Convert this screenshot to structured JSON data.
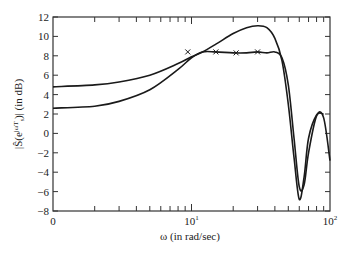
{
  "chart_data": {
    "type": "line",
    "title": "",
    "xlabel": "ω (in rad/sec)",
    "ylabel": "|Ŝ(e^{jωT_s})|  (in dB)",
    "xscale": "log",
    "xlim": [
      1,
      100
    ],
    "ylim": [
      -8,
      12
    ],
    "grid": false,
    "legend": null,
    "x_tick_labels": [
      "0",
      "10¹",
      "10²"
    ],
    "y_ticks": [
      -8,
      -6,
      -4,
      -2,
      0,
      2,
      4,
      6,
      8,
      10,
      12
    ],
    "series": [
      {
        "name": "curve-A (upper low-frequency)",
        "x": [
          1,
          2,
          3,
          5,
          8,
          10,
          12,
          15,
          20,
          25,
          30,
          35,
          40,
          45,
          50,
          55,
          60,
          65,
          70,
          80,
          90
        ],
        "y": [
          4.8,
          5.0,
          5.3,
          6.0,
          7.2,
          7.9,
          8.4,
          9.2,
          10.3,
          10.9,
          11.1,
          10.9,
          9.8,
          7.5,
          3.0,
          -2.5,
          -6.8,
          -4.5,
          -0.5,
          1.9,
          2.0
        ]
      },
      {
        "name": "curve-B (lower low-frequency)",
        "x": [
          1,
          2,
          3,
          5,
          8,
          10,
          12,
          15,
          20,
          25,
          30,
          35,
          40,
          45,
          50,
          55,
          60,
          65,
          70,
          80,
          90,
          100
        ],
        "y": [
          2.6,
          2.8,
          3.3,
          4.5,
          6.6,
          7.8,
          8.4,
          8.4,
          8.3,
          8.3,
          8.4,
          8.3,
          8.4,
          7.8,
          5.0,
          -0.5,
          -5.5,
          -5.3,
          -2.0,
          1.8,
          1.6,
          -2.8
        ]
      }
    ],
    "markers": {
      "symbol": "×",
      "x": [
        9.4,
        15,
        21,
        30
      ],
      "y": [
        8.4,
        8.4,
        8.3,
        8.4
      ]
    }
  },
  "axes": {
    "x_label": "ω (in rad/sec)",
    "y_label_main": "|Ŝ(e",
    "y_label_sup": "jωT",
    "y_label_sub": "s",
    "y_label_tail": ")|  (in dB)",
    "x_ticks": [
      {
        "label": "0"
      },
      {
        "label": "10"
      },
      {
        "label": "10"
      }
    ],
    "x_tick_sup": [
      "",
      "1",
      "2"
    ],
    "y_ticks": [
      "−8",
      "−6",
      "−4",
      "−2",
      "0",
      "2",
      "4",
      "6",
      "8",
      "10",
      "12"
    ]
  },
  "style": {
    "line_color": "#1a1a1a",
    "axis_color": "#333333",
    "background": "#ffffff"
  }
}
